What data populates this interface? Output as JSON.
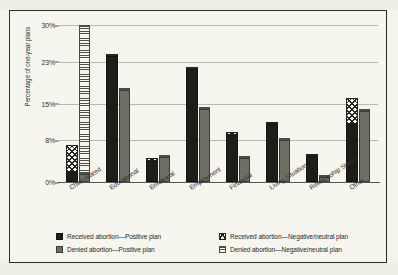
{
  "chart_data": {
    "type": "bar",
    "title": "",
    "xlabel": "",
    "ylabel": "Percentage of one-year plans",
    "ylim": [
      0,
      30
    ],
    "yticks": [
      0,
      8,
      15,
      23,
      30
    ],
    "ytick_labels": [
      "0%",
      "8%",
      "15%",
      "23%",
      "30%"
    ],
    "grid": true,
    "legend_position": "bottom",
    "categories": [
      "Child-related",
      "Educational",
      "Emotional",
      "Employment",
      "Financial",
      "Living Situation",
      "Relationship Status",
      "Other"
    ],
    "series": [
      {
        "name": "Received abortion—Positive plan",
        "pattern": "solid-black",
        "color": "#1d1e19",
        "values": [
          2.0,
          24.0,
          4.0,
          21.5,
          9.0,
          11.0,
          5.0,
          11.0
        ]
      },
      {
        "name": "Received abortion—Negative/neutral plan",
        "pattern": "crosshatch",
        "color": "#23241d",
        "values": [
          5.0,
          0.3,
          0.5,
          0.4,
          0.5,
          0.5,
          0.4,
          5.0
        ]
      },
      {
        "name": "Denied abortion—Positive plan",
        "pattern": "solid-gray",
        "color": "#6e6f64",
        "values": [
          1.5,
          17.5,
          4.7,
          14.0,
          4.5,
          8.0,
          1.0,
          13.5
        ]
      },
      {
        "name": "Denied abortion—Negative/neutral plan",
        "pattern": "horizontal-stripe",
        "color": "#4f5047",
        "values": [
          28.5,
          0.4,
          0.4,
          0.3,
          0.4,
          0.4,
          0.2,
          0.5
        ]
      }
    ]
  },
  "legend": {
    "items": [
      {
        "label": "Received abortion—Positive plan",
        "swatch": "solid-black-swatch"
      },
      {
        "label": "Denied abortion—Positive plan",
        "swatch": "solid-gray-swatch"
      },
      {
        "label": "Received abortion—Negative/neutral plan",
        "swatch": "crosshatch-swatch"
      },
      {
        "label": "Denied abortion—Negative/neutral plan",
        "swatch": "horizontal-stripe-swatch"
      }
    ]
  }
}
